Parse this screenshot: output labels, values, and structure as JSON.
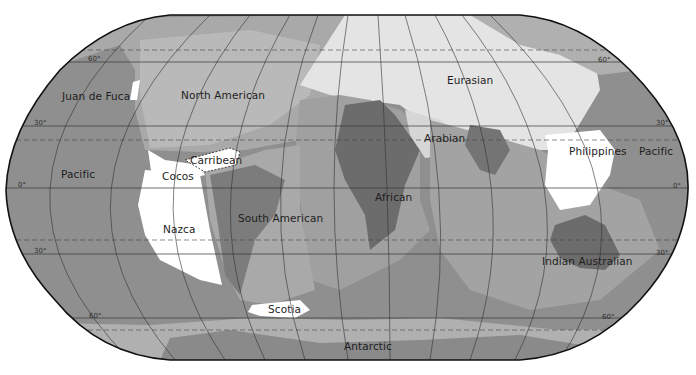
{
  "map": {
    "title": "Tectonic plates world map",
    "projection": "Robinson",
    "colors": {
      "background": "#ffffff",
      "ocean_plate_dark": "#8f8f8f",
      "plate_mid": "#a9a9a9",
      "plate_light": "#c2c2c2",
      "continent_dark": "#6c6c6c",
      "eurasia_fill": "#e4e4e4",
      "minor_plate": "#ffffff",
      "outline": "#111111"
    },
    "plates": [
      {
        "id": "juan-de-fuca",
        "label": "Juan de Fuca"
      },
      {
        "id": "north-american",
        "label": "North American"
      },
      {
        "id": "eurasian",
        "label": "Eurasian"
      },
      {
        "id": "arabian",
        "label": "Arabian"
      },
      {
        "id": "philippines",
        "label": "Philippines"
      },
      {
        "id": "pacific-west",
        "label": "Pacific"
      },
      {
        "id": "pacific-east",
        "label": "Pacific"
      },
      {
        "id": "carribean",
        "label": "Carribean"
      },
      {
        "id": "cocos",
        "label": "Cocos"
      },
      {
        "id": "nazca",
        "label": "Nazca"
      },
      {
        "id": "south-american",
        "label": "South American"
      },
      {
        "id": "african",
        "label": "African"
      },
      {
        "id": "indian-australian",
        "label": "Indian Australian"
      },
      {
        "id": "scotia",
        "label": "Scotia"
      },
      {
        "id": "antarctic",
        "label": "Antarctic"
      }
    ],
    "latitude_labels": {
      "left": [
        "60°",
        "30°",
        "0°",
        "30°",
        "60°"
      ],
      "right": [
        "60°",
        "30°",
        "0°",
        "30°",
        "60°"
      ]
    }
  }
}
